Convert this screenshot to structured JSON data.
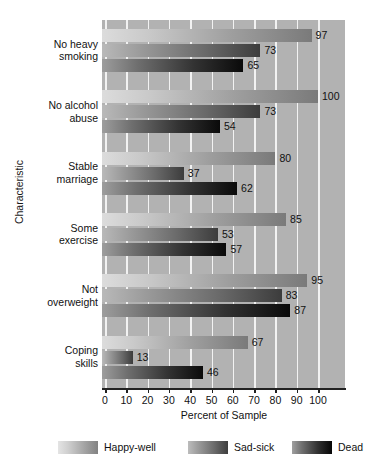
{
  "chart_data": {
    "type": "bar",
    "orientation": "horizontal",
    "title": "",
    "xlabel": "Percent of Sample",
    "ylabel": "Characteristic",
    "xlim": [
      0,
      100
    ],
    "xticks": [
      0,
      10,
      20,
      30,
      40,
      50,
      60,
      70,
      80,
      90,
      100
    ],
    "grid": true,
    "grid_axis": "x",
    "legend_position": "bottom",
    "categories": [
      "No heavy smoking",
      "No alcohol abuse",
      "Stable marriage",
      "Some exercise",
      "Not overweight",
      "Coping skills"
    ],
    "series": [
      {
        "name": "Happy-well",
        "color": "#c9c9c9",
        "values": [
          97,
          100,
          80,
          85,
          95,
          67
        ]
      },
      {
        "name": "Sad-sick",
        "color": "#8a8a8a",
        "values": [
          73,
          73,
          37,
          53,
          83,
          13
        ]
      },
      {
        "name": "Dead",
        "color": "#2b2b2b",
        "values": [
          65,
          54,
          62,
          57,
          87,
          46
        ]
      }
    ]
  },
  "axis": {
    "x_title": "Percent of Sample",
    "y_title": "Characteristic",
    "x_tick_labels": [
      "0",
      "10",
      "20",
      "30",
      "40",
      "50",
      "60",
      "70",
      "80",
      "90",
      "100"
    ]
  },
  "categories": [
    {
      "line1": "No heavy",
      "line2": "smoking"
    },
    {
      "line1": "No alcohol",
      "line2": "abuse"
    },
    {
      "line1": "Stable",
      "line2": "marriage"
    },
    {
      "line1": "Some",
      "line2": "exercise"
    },
    {
      "line1": "Not",
      "line2": "overweight"
    },
    {
      "line1": "Coping",
      "line2": "skills"
    }
  ],
  "legend": {
    "items": [
      {
        "label": "Happy-well"
      },
      {
        "label": "Sad-sick"
      },
      {
        "label": "Dead"
      }
    ]
  },
  "plot_colors": {
    "plot_background": "#b2b2b2",
    "gridline": "#f2f2f2",
    "axis": "#222222",
    "page_background": "#ffffff"
  }
}
